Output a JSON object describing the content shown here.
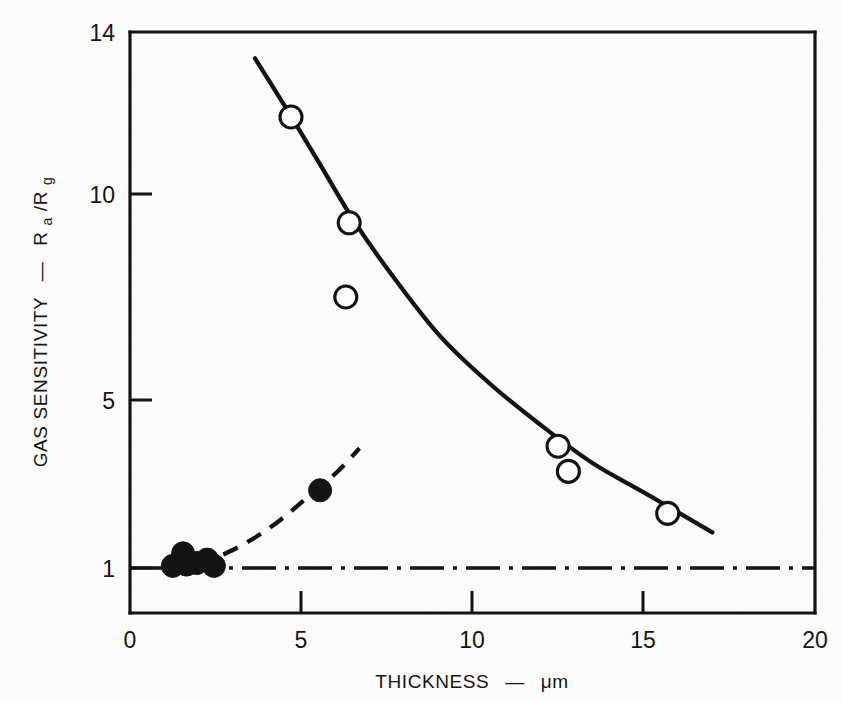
{
  "chart_data": {
    "type": "scatter",
    "title": "",
    "xlabel": "THICKNESS",
    "xlabel_unit": "μm",
    "xlabel_full": "THICKNESS — μm",
    "ylabel": "GAS SENSITIVITY",
    "ylabel_unit": "Ra/Rg",
    "ylabel_full": "GAS SENSITIVITY — Ra/Rg",
    "xlim": [
      0,
      20
    ],
    "ylim": [
      1,
      14
    ],
    "xticks": [
      0,
      5,
      10,
      15,
      20
    ],
    "xtick_labels": [
      "0",
      "5",
      "10",
      "15",
      "20"
    ],
    "yticks": [
      1,
      5,
      10,
      14
    ],
    "ytick_labels": [
      "1",
      "5",
      "10",
      "14"
    ],
    "grid": false,
    "legend": "none",
    "axis_color": "#111111",
    "background": "#fdfdfc",
    "series": [
      {
        "name": "open-circles",
        "marker": "open circle",
        "line_style": "solid",
        "points": [
          {
            "x": 4.7,
            "y": 11.9
          },
          {
            "x": 6.4,
            "y": 9.3
          },
          {
            "x": 6.3,
            "y": 7.5
          },
          {
            "x": 12.5,
            "y": 3.9
          },
          {
            "x": 12.8,
            "y": 3.3
          },
          {
            "x": 15.7,
            "y": 2.3
          }
        ],
        "fit_curve": [
          {
            "x": 3.65,
            "y": 13.35
          },
          {
            "x": 4.5,
            "y": 12.2
          },
          {
            "x": 5.5,
            "y": 10.8
          },
          {
            "x": 6.5,
            "y": 9.4
          },
          {
            "x": 7.5,
            "y": 8.2
          },
          {
            "x": 9.0,
            "y": 6.6
          },
          {
            "x": 10.5,
            "y": 5.4
          },
          {
            "x": 12.0,
            "y": 4.4
          },
          {
            "x": 13.5,
            "y": 3.5
          },
          {
            "x": 15.0,
            "y": 2.8
          },
          {
            "x": 17.0,
            "y": 1.85
          }
        ]
      },
      {
        "name": "filled-circles",
        "marker": "filled circle",
        "line_style": "dashed",
        "points": [
          {
            "x": 1.25,
            "y": 1.05
          },
          {
            "x": 1.55,
            "y": 1.35
          },
          {
            "x": 1.65,
            "y": 1.08
          },
          {
            "x": 1.95,
            "y": 1.12
          },
          {
            "x": 2.25,
            "y": 1.2
          },
          {
            "x": 2.45,
            "y": 1.05
          },
          {
            "x": 5.55,
            "y": 2.85
          }
        ],
        "fit_curve": [
          {
            "x": 1.2,
            "y": 1.02
          },
          {
            "x": 2.0,
            "y": 1.12
          },
          {
            "x": 2.8,
            "y": 1.35
          },
          {
            "x": 3.6,
            "y": 1.7
          },
          {
            "x": 4.4,
            "y": 2.15
          },
          {
            "x": 5.2,
            "y": 2.7
          },
          {
            "x": 6.0,
            "y": 3.25
          },
          {
            "x": 6.7,
            "y": 3.85
          }
        ]
      },
      {
        "name": "unity-baseline",
        "marker": "none",
        "line_style": "dash-dot",
        "y_value": 1,
        "x_range": [
          0,
          20
        ]
      }
    ]
  },
  "axes": {
    "y_title_main": "GAS SENSITIVITY",
    "y_title_dash": "—",
    "y_title_r": "R",
    "y_title_a": "a",
    "y_title_slash": "/R",
    "y_title_g": "g",
    "x_title_main": "THICKNESS",
    "x_title_dash": "—",
    "x_title_unit": "μm",
    "xtick_0": "0",
    "xtick_5": "5",
    "xtick_10": "10",
    "xtick_15": "15",
    "xtick_20": "20",
    "ytick_1": "1",
    "ytick_5": "5",
    "ytick_10": "10",
    "ytick_14": "14"
  }
}
